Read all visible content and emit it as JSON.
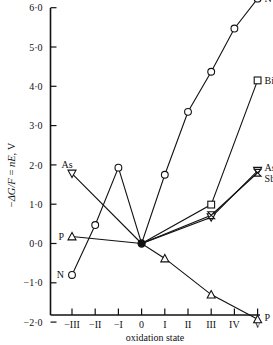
{
  "chart_data": {
    "type": "line",
    "title": "",
    "xlabel": "oxidation state",
    "ylabel": "−ΔG/F = nE, V",
    "ylabel_parts": {
      "minus": "−",
      "delta_g": "ΔG",
      "slash_f": "/F",
      "equals": " = ",
      "ne": "nE",
      "comma_v": ", V"
    },
    "x_categories": [
      "−III",
      "−II",
      "−I",
      "0",
      "I",
      "II",
      "III",
      "IV",
      "V"
    ],
    "x_values": [
      -3,
      -2,
      -1,
      0,
      1,
      2,
      3,
      4,
      5
    ],
    "y_ticks": [
      "6·0",
      "5·0",
      "4·0",
      "3·0",
      "2·0",
      "1·0",
      "0·0",
      "−1·0",
      "−2·0"
    ],
    "y_tick_values": [
      6,
      5,
      4,
      3,
      2,
      1,
      0,
      -1,
      -2
    ],
    "ylim": [
      -2,
      6.6
    ],
    "xlim": [
      -3.4,
      5.35
    ],
    "grid": false,
    "legend_position": "inline-endpoint-labels",
    "series": [
      {
        "name": "N",
        "label": "N",
        "marker": "circle",
        "label_positions": [
          "left-start",
          "right-end"
        ],
        "x": [
          -3,
          -2,
          -1,
          0,
          1,
          2,
          3,
          4,
          5
        ],
        "y": [
          -0.8,
          0.47,
          1.93,
          0.0,
          1.75,
          3.35,
          4.37,
          5.47,
          6.23
        ]
      },
      {
        "name": "P",
        "label": "P",
        "marker": "triangle-up",
        "label_positions": [
          "left-start",
          "right-end"
        ],
        "x": [
          -3,
          0,
          1,
          3,
          5
        ],
        "y": [
          0.18,
          0.0,
          -0.38,
          -1.3,
          -1.93
        ]
      },
      {
        "name": "As",
        "label": "As",
        "marker": "triangle-down",
        "label_positions": [
          "left-start",
          "right-end"
        ],
        "x": [
          -3,
          0,
          3,
          5
        ],
        "y": [
          1.78,
          0.0,
          0.67,
          1.85
        ]
      },
      {
        "name": "Sb",
        "label": "Sb",
        "marker": "bowtie",
        "label_positions": [
          "right-end"
        ],
        "x": [
          0,
          3,
          5
        ],
        "y": [
          0.0,
          0.72,
          1.8
        ]
      },
      {
        "name": "Bi",
        "label": "Bi",
        "marker": "square",
        "label_positions": [
          "right-end"
        ],
        "x": [
          0,
          3,
          5
        ],
        "y": [
          0.0,
          0.99,
          4.15
        ]
      }
    ],
    "origin_point": {
      "x": 0,
      "y": 0,
      "marker": "filled-circle",
      "shared_by": [
        "N",
        "P",
        "As",
        "Sb",
        "Bi"
      ]
    },
    "colors": {
      "ink": "#111111",
      "background": "#ffffff"
    }
  },
  "labels": {
    "as_left": "As",
    "p_left": "P",
    "n_left": "N",
    "n_right": "N",
    "bi_right": "Bi",
    "as_right": "As",
    "sb_right": "Sb",
    "p_right": "P"
  }
}
